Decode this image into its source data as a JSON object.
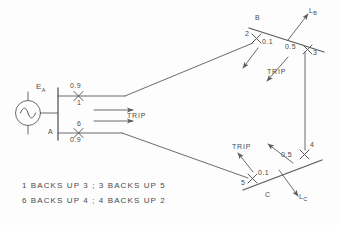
{
  "figure": {
    "type": "one-line-protection-coordination-diagram",
    "source": {
      "name": "voltage-source",
      "label": "E",
      "label_subscript": "A",
      "symbol": "ac-source-sine-circle"
    },
    "buses": [
      {
        "id": "A",
        "label": "A",
        "orientation": "vertical"
      },
      {
        "id": "B",
        "label": "B",
        "orientation": "diagonal"
      },
      {
        "id": "C",
        "label": "C",
        "orientation": "diagonal"
      }
    ],
    "loads": [
      {
        "id": "LB",
        "label": "L",
        "label_subscript": "B",
        "at_bus": "B"
      },
      {
        "id": "LC",
        "label": "L",
        "label_subscript": "C",
        "at_bus": "C"
      }
    ],
    "breakers": [
      {
        "id": "1",
        "number": "1",
        "time": "0.9",
        "bus": "A",
        "number_pos": "below",
        "time_pos": "above"
      },
      {
        "id": "6",
        "number": "6",
        "time": "0.9",
        "bus": "A",
        "number_pos": "above",
        "time_pos": "below"
      },
      {
        "id": "2",
        "number": "2",
        "time": "0.1",
        "bus": "B",
        "number_pos": "left",
        "time_pos": "right"
      },
      {
        "id": "3",
        "number": "3",
        "time": "0.5",
        "bus": "B",
        "number_pos": "right",
        "time_pos": "left"
      },
      {
        "id": "5",
        "number": "5",
        "time": "0.1",
        "bus": "C",
        "number_pos": "left",
        "time_pos": "right"
      },
      {
        "id": "4",
        "number": "4",
        "time": "0.5",
        "bus": "C",
        "number_pos": "right",
        "time_pos": "left"
      }
    ],
    "trip_labels": [
      {
        "id": "trip-a",
        "text": "TRIP",
        "near_bus": "A",
        "arrows": 2
      },
      {
        "id": "trip-b",
        "text": "TRIP",
        "near_bus": "B",
        "arrows": 2
      },
      {
        "id": "trip-c",
        "text": "TRIP",
        "near_bus": "C",
        "arrows": 2
      }
    ],
    "caption": {
      "line1": "1 BACKS UP 3 ; 3 BACKS UP 5",
      "line2": "6 BACKS UP 4 ; 4 BACKS UP 2"
    },
    "colors": {
      "line": "#5a5a5a",
      "text": "#4a4a4a",
      "background": "#fdfdfd"
    }
  }
}
